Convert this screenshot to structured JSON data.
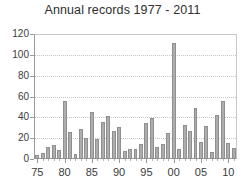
{
  "chart_data": {
    "type": "bar",
    "title": "Annual records 1977 - 2011",
    "xlabel": "",
    "ylabel": "",
    "ylim": [
      0,
      120
    ],
    "xlim": [
      1974.4,
      2011.6
    ],
    "grid": "horizontal-dotted",
    "legend": "none",
    "bar_color": "#adadad",
    "bar_edge_color": "#8f8f8f",
    "yticks": [
      0,
      20,
      40,
      60,
      80,
      100,
      120
    ],
    "ytick_labels": [
      "0",
      "20",
      "40",
      "60",
      "80",
      "100",
      "120"
    ],
    "xticks": [
      1975,
      1980,
      1985,
      1990,
      1995,
      2000,
      2005,
      2010
    ],
    "xtick_labels": [
      "75",
      "80",
      "85",
      "90",
      "95",
      "00",
      "05",
      "10"
    ],
    "categories": [
      1975,
      1976,
      1977,
      1978,
      1979,
      1980,
      1981,
      1982,
      1983,
      1984,
      1985,
      1986,
      1987,
      1988,
      1989,
      1990,
      1991,
      1992,
      1993,
      1994,
      1995,
      1996,
      1997,
      1998,
      1999,
      2000,
      2001,
      2002,
      2003,
      2004,
      2005,
      2006,
      2007,
      2008,
      2009,
      2010,
      2011
    ],
    "values": [
      4,
      6,
      12,
      13,
      9,
      56,
      26,
      5,
      29,
      20,
      45,
      19,
      36,
      41,
      27,
      31,
      8,
      10,
      10,
      14,
      35,
      39,
      12,
      14,
      25,
      111,
      10,
      33,
      27,
      49,
      16,
      32,
      7,
      42,
      56,
      15,
      11
    ]
  }
}
